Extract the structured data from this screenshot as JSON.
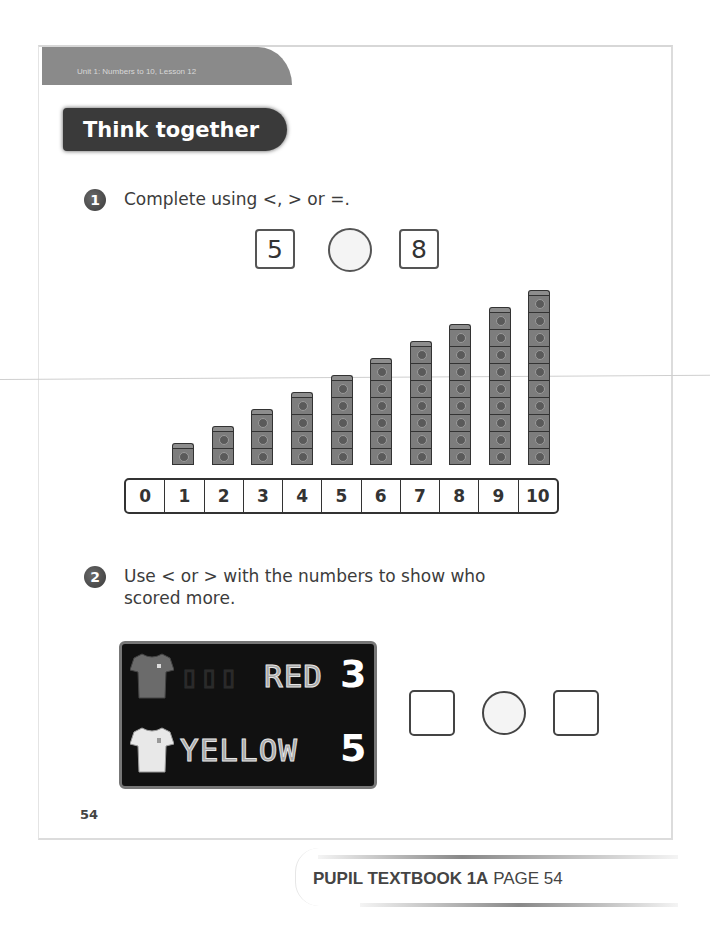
{
  "header": {
    "unit_banner": "Unit 1: Numbers to 10, Lesson 12",
    "section_title": "Think together"
  },
  "question1": {
    "number": "1",
    "prompt": "Complete using <, > or =.",
    "left_value": "5",
    "right_value": "8",
    "comparison_slot": ""
  },
  "cube_towers": {
    "counts": [
      0,
      1,
      2,
      3,
      4,
      5,
      6,
      7,
      8,
      9,
      10
    ]
  },
  "number_track": {
    "labels": [
      "0",
      "1",
      "2",
      "3",
      "4",
      "5",
      "6",
      "7",
      "8",
      "9",
      "10"
    ]
  },
  "question2": {
    "number": "2",
    "prompt_line1": "Use < or > with the numbers to show who",
    "prompt_line2": "scored more.",
    "scoreboard": {
      "teams": [
        {
          "name": "RED",
          "score": "3",
          "shirt_color": "#6b6b6b"
        },
        {
          "name": "YELLOW",
          "score": "5",
          "shirt_color": "#e8e8e8"
        }
      ]
    },
    "answer": {
      "left_box": "",
      "comparison_slot": "",
      "right_box": ""
    }
  },
  "footer": {
    "page_number": "54",
    "book_label": "PUPIL TEXTBOOK 1A",
    "page_label": "PAGE 54"
  }
}
